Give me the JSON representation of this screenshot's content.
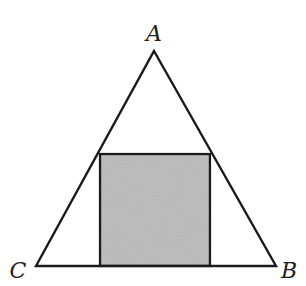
{
  "diagram": {
    "type": "geometry",
    "colors": {
      "stroke": "#1a1a1a",
      "square_fill": "#b3b3b3",
      "background": "#ffffff"
    },
    "triangle": {
      "vertices": {
        "A": [
          154,
          51
        ],
        "B": [
          276,
          266
        ],
        "C": [
          36,
          266
        ]
      }
    },
    "square": {
      "x": 100,
      "y": 154,
      "width": 110,
      "height": 112,
      "shaded": true
    },
    "labels": {
      "A": "A",
      "B": "B",
      "C": "C"
    }
  }
}
